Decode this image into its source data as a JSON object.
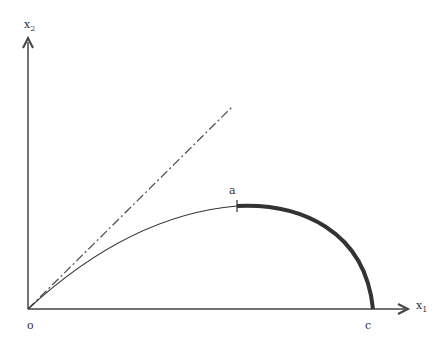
{
  "labels": {
    "y_axis": "x",
    "y_axis_sub": "2",
    "x_axis": "x",
    "x_axis_sub": "1",
    "origin": "o",
    "point_a": "a",
    "point_c": "c"
  },
  "colors": {
    "line": "#333333"
  }
}
